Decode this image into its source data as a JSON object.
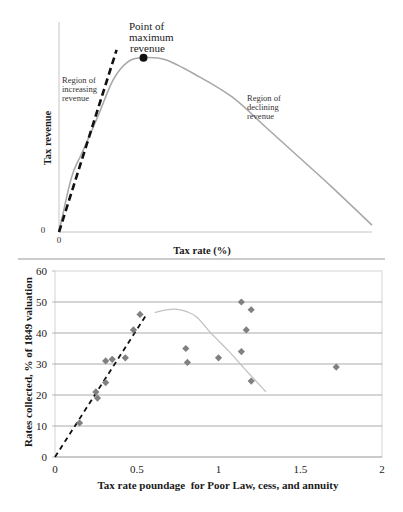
{
  "chart_data": [
    {
      "type": "line",
      "title": "",
      "xlabel": "Tax rate (%)",
      "ylabel": "Tax revenue",
      "x_tick_labels": [
        "0"
      ],
      "y_tick_labels": [
        "0"
      ],
      "xlim": [
        0,
        100
      ],
      "ylim": [
        0,
        100
      ],
      "grid": false,
      "series": [
        {
          "name": "Tax revenue curve",
          "style": "solid",
          "color": "#a8a8a8",
          "points": [
            [
              0,
              0
            ],
            [
              4,
              26
            ],
            [
              7.3,
              37.5
            ],
            [
              12.6,
              55.7
            ],
            [
              17.3,
              72.4
            ],
            [
              22,
              81
            ],
            [
              27,
              83
            ],
            [
              34,
              82
            ],
            [
              43.5,
              75
            ],
            [
              55.3,
              64.3
            ],
            [
              66,
              50
            ],
            [
              76.6,
              35.7
            ],
            [
              87.2,
              21.4
            ],
            [
              100,
              3.3
            ]
          ]
        },
        {
          "name": "Linear revenue line",
          "style": "dashed",
          "color": "#111111",
          "points": [
            [
              0,
              0
            ],
            [
              18.4,
              86.7
            ]
          ]
        }
      ],
      "markers": [
        {
          "name": "Point of maximum revenue",
          "x": 27,
          "y": 83,
          "color": "#111111"
        }
      ],
      "annotations": [
        {
          "lines": [
            "Point of",
            "maximum",
            "revenue"
          ]
        },
        {
          "lines": [
            "Region of",
            "increasing",
            "revenue"
          ]
        },
        {
          "lines": [
            "Region of",
            "declining",
            "revenue"
          ]
        }
      ]
    },
    {
      "type": "scatter",
      "title": "",
      "xlabel": "Tax rate poundage  for Poor Law, cess, and annuity",
      "ylabel": "Rates collected, % of 1849 valuation",
      "xlim": [
        0,
        2
      ],
      "ylim": [
        0,
        60
      ],
      "x_ticks": [
        0,
        0.5,
        1,
        1.5,
        2
      ],
      "x_tick_labels": [
        "0",
        "0.5",
        "1",
        "1.5",
        "2"
      ],
      "y_ticks": [
        0,
        10,
        20,
        30,
        40,
        50,
        60
      ],
      "y_tick_labels": [
        "0",
        "10",
        "20",
        "30",
        "40",
        "50",
        "60"
      ],
      "grid": "horizontal",
      "legend": "none",
      "series": [
        {
          "name": "Observations",
          "kind": "scatter",
          "marker": "diamond",
          "color": "#808080",
          "points": [
            [
              0.15,
              11
            ],
            [
              0.25,
              21
            ],
            [
              0.26,
              19
            ],
            [
              0.31,
              24
            ],
            [
              0.31,
              31
            ],
            [
              0.35,
              31.5
            ],
            [
              0.43,
              32
            ],
            [
              0.48,
              41
            ],
            [
              0.52,
              46
            ],
            [
              0.8,
              35
            ],
            [
              0.81,
              30.5
            ],
            [
              1.0,
              32
            ],
            [
              1.14,
              34
            ],
            [
              1.14,
              50
            ],
            [
              1.17,
              41
            ],
            [
              1.2,
              47.5
            ],
            [
              1.2,
              24.5
            ],
            [
              1.72,
              29
            ]
          ]
        },
        {
          "name": "Linear trend",
          "kind": "line",
          "style": "dashed",
          "color": "#111111",
          "points": [
            [
              0,
              0
            ],
            [
              0.56,
              46
            ]
          ]
        },
        {
          "name": "Fitted curve",
          "kind": "line",
          "style": "solid",
          "color": "#c2c2c2",
          "points": [
            [
              0.61,
              46.6
            ],
            [
              0.67,
              47.4
            ],
            [
              0.74,
              47.7
            ],
            [
              0.81,
              46.8
            ],
            [
              0.87,
              45
            ],
            [
              0.95,
              40.2
            ],
            [
              1.06,
              34.3
            ],
            [
              1.14,
              29.6
            ],
            [
              1.22,
              25
            ],
            [
              1.29,
              21
            ]
          ]
        }
      ]
    }
  ]
}
